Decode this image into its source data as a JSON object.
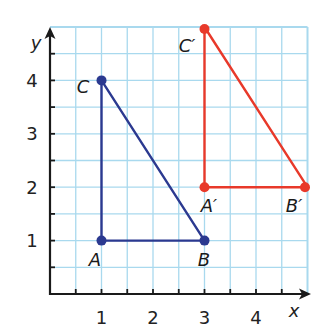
{
  "diagram": {
    "type": "coordinate-plane-translation",
    "axes": {
      "x_label": "x",
      "y_label": "y",
      "x_ticks": [
        "1",
        "2",
        "3",
        "4"
      ],
      "y_ticks": [
        "1",
        "2",
        "3",
        "4"
      ],
      "grid_max": 5,
      "grid_step": 0.5
    },
    "colors": {
      "original": "#2b3990",
      "image": "#e8392a",
      "grid": "#a9d9ee",
      "axis": "#1a1a1a"
    },
    "triangles": [
      {
        "name": "original",
        "vertices": [
          {
            "label": "A",
            "x": 1,
            "y": 1
          },
          {
            "label": "B",
            "x": 3,
            "y": 1
          },
          {
            "label": "C",
            "x": 1,
            "y": 4
          }
        ]
      },
      {
        "name": "image",
        "vertices": [
          {
            "label": "A′",
            "x": 3,
            "y": 2
          },
          {
            "label": "B′",
            "x": 5,
            "y": 2
          },
          {
            "label": "C′",
            "x": 3,
            "y": 5
          }
        ]
      }
    ]
  }
}
